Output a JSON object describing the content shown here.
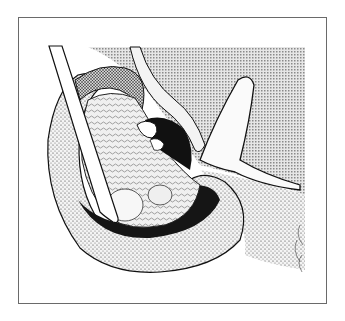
{
  "figure": {
    "kind": "anatomical-illustration",
    "style": "stipple-pen-drawing",
    "colors": {
      "background": "#ffffff",
      "frame": "#6a6a6a",
      "ink": "#111111",
      "halftone": "#bdbdbd"
    }
  }
}
